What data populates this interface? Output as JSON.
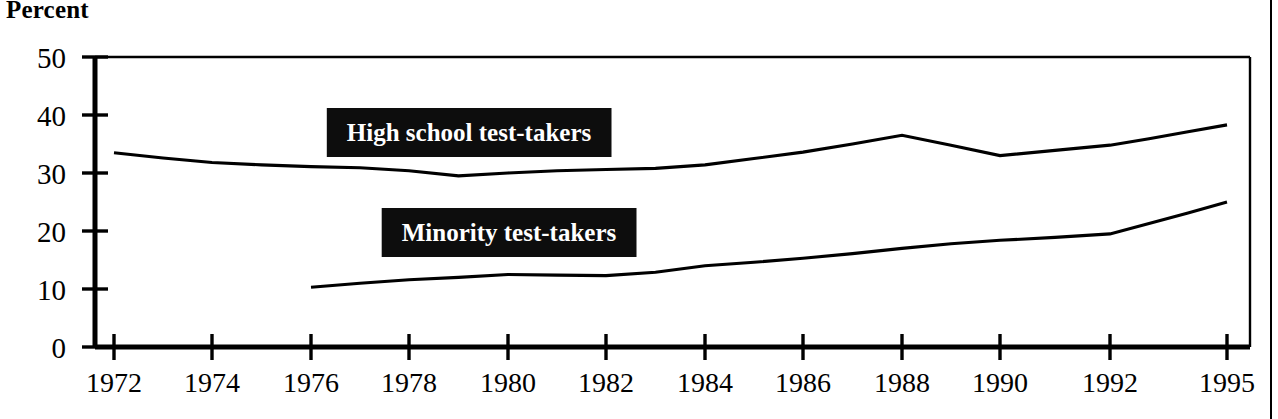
{
  "title": "Percent",
  "chart_data": {
    "type": "line",
    "title": "Percent",
    "xlabel": "",
    "ylabel": "Percent",
    "ylim": [
      0,
      50
    ],
    "yticks": [
      0,
      10,
      20,
      30,
      40,
      50
    ],
    "ytick_labels": [
      "0",
      "10",
      "20",
      "30",
      "40",
      "50"
    ],
    "xticks": [
      1972,
      1974,
      1976,
      1978,
      1980,
      1982,
      1984,
      1986,
      1988,
      1990,
      1992,
      1995
    ],
    "xtick_labels": [
      "1972",
      "1974",
      "1976",
      "1978",
      "1980",
      "1982",
      "1984",
      "1986",
      "1988",
      "1990",
      "1992",
      "1995"
    ],
    "xlim": [
      1971,
      1995
    ],
    "grid": false,
    "legend_position": "inline-annotations",
    "series": [
      {
        "name": "High school test-takers",
        "x": [
          1972,
          1973,
          1974,
          1975,
          1976,
          1977,
          1978,
          1979,
          1980,
          1981,
          1982,
          1983,
          1984,
          1985,
          1986,
          1987,
          1988,
          1989,
          1990,
          1991,
          1992,
          1993,
          1994,
          1995
        ],
        "values": [
          33.5,
          32.6,
          31.8,
          31.4,
          31.1,
          30.9,
          30.4,
          29.5,
          30.0,
          30.4,
          30.6,
          30.8,
          31.4,
          32.5,
          33.6,
          35.0,
          36.5,
          34.8,
          33.0,
          33.9,
          34.8,
          35.9,
          37.1,
          38.3
        ]
      },
      {
        "name": "Minority test-takers",
        "x": [
          1976,
          1977,
          1978,
          1979,
          1980,
          1981,
          1982,
          1983,
          1984,
          1985,
          1986,
          1987,
          1988,
          1989,
          1990,
          1991,
          1992,
          1993,
          1994,
          1995
        ],
        "values": [
          10.3,
          11.0,
          11.6,
          12.0,
          12.5,
          12.4,
          12.3,
          12.9,
          14.0,
          14.6,
          15.3,
          16.1,
          17.0,
          17.8,
          18.4,
          18.9,
          19.5,
          21.3,
          23.1,
          25.0
        ]
      }
    ],
    "annotations": [
      {
        "label": "High school test-takers",
        "x": 1977.1,
        "y_pixel_top": 110
      },
      {
        "label": "Minority test-takers",
        "x": 1978.0,
        "y_pixel_top": 210
      }
    ]
  },
  "colors": {
    "line": "#000000",
    "annotation_background": "#0d0d0d",
    "annotation_text": "#ffffff",
    "axis": "#000000"
  }
}
